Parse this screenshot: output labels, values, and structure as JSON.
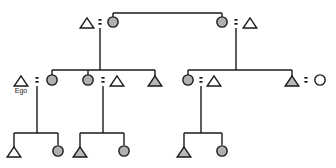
{
  "diagram": {
    "canvas": {
      "width": 336,
      "height": 168
    },
    "background_color": "#ffffff",
    "line_color": "#1a1a1a",
    "male_symbol": "triangle",
    "female_symbol": "circle",
    "shaded_fill": "#b4b4b4",
    "unshaded_fill": "#ffffff",
    "marriage_symbol": "equals-sign",
    "generations": 3,
    "nodes": [
      {
        "id": "g1-m1",
        "name": "generation1-male-left",
        "sex": "male",
        "shaded": false,
        "cx": 87,
        "cy": 23,
        "size": 11,
        "label": ""
      },
      {
        "id": "g1-f1",
        "name": "generation1-female-left",
        "sex": "female",
        "shaded": true,
        "cx": 113,
        "cy": 22,
        "size": 11,
        "label": ""
      },
      {
        "id": "g1-f2",
        "name": "generation1-female-right",
        "sex": "female",
        "shaded": true,
        "cx": 222,
        "cy": 22,
        "size": 11,
        "label": ""
      },
      {
        "id": "g1-m2",
        "name": "generation1-male-right",
        "sex": "male",
        "shaded": false,
        "cx": 250,
        "cy": 23,
        "size": 11,
        "label": ""
      },
      {
        "id": "g2-m1",
        "name": "generation2-ego-male",
        "sex": "male",
        "shaded": false,
        "cx": 21,
        "cy": 81,
        "size": 11,
        "label": "Ego"
      },
      {
        "id": "g2-f1",
        "name": "generation2-female-spouse-1",
        "sex": "female",
        "shaded": true,
        "cx": 52,
        "cy": 80,
        "size": 11,
        "label": ""
      },
      {
        "id": "g2-f2",
        "name": "generation2-female-sibling",
        "sex": "female",
        "shaded": true,
        "cx": 88,
        "cy": 80,
        "size": 11,
        "label": ""
      },
      {
        "id": "g2-m2",
        "name": "generation2-male-spouse-2",
        "sex": "male",
        "shaded": false,
        "cx": 117,
        "cy": 81,
        "size": 11,
        "label": ""
      },
      {
        "id": "g2-m3",
        "name": "generation2-male-sibling",
        "sex": "male",
        "shaded": true,
        "cx": 155,
        "cy": 81,
        "size": 11,
        "label": ""
      },
      {
        "id": "g2-f3",
        "name": "generation2-female-sibling-r",
        "sex": "female",
        "shaded": true,
        "cx": 188,
        "cy": 80,
        "size": 11,
        "label": ""
      },
      {
        "id": "g2-m4",
        "name": "generation2-male-spouse-3",
        "sex": "male",
        "shaded": false,
        "cx": 214,
        "cy": 81,
        "size": 11,
        "label": ""
      },
      {
        "id": "g2-m5",
        "name": "generation2-male-sibling-r",
        "sex": "male",
        "shaded": true,
        "cx": 292,
        "cy": 81,
        "size": 11,
        "label": ""
      },
      {
        "id": "g2-f4",
        "name": "generation2-female-spouse-4",
        "sex": "female",
        "shaded": false,
        "cx": 320,
        "cy": 80,
        "size": 11,
        "label": ""
      },
      {
        "id": "g3-m1",
        "name": "generation3-male-1",
        "sex": "male",
        "shaded": false,
        "cx": 14,
        "cy": 152,
        "size": 11,
        "label": ""
      },
      {
        "id": "g3-f1",
        "name": "generation3-female-1",
        "sex": "female",
        "shaded": true,
        "cx": 58,
        "cy": 151,
        "size": 11,
        "label": ""
      },
      {
        "id": "g3-m2",
        "name": "generation3-male-2",
        "sex": "male",
        "shaded": true,
        "cx": 80,
        "cy": 152,
        "size": 11,
        "label": ""
      },
      {
        "id": "g3-f2",
        "name": "generation3-female-2",
        "sex": "female",
        "shaded": true,
        "cx": 124,
        "cy": 151,
        "size": 11,
        "label": ""
      },
      {
        "id": "g3-m3",
        "name": "generation3-male-3",
        "sex": "male",
        "shaded": true,
        "cx": 184,
        "cy": 152,
        "size": 11,
        "label": ""
      },
      {
        "id": "g3-f3",
        "name": "generation3-female-3",
        "sex": "female",
        "shaded": true,
        "cx": 222,
        "cy": 151,
        "size": 11,
        "label": ""
      }
    ],
    "marriages": [
      {
        "id": "mar-1",
        "name": "marriage-generation1-left",
        "x": 100,
        "y": 22
      },
      {
        "id": "mar-2",
        "name": "marriage-generation1-right",
        "x": 236,
        "y": 22
      },
      {
        "id": "mar-3",
        "name": "marriage-ego-spouse",
        "x": 37,
        "y": 80
      },
      {
        "id": "mar-4",
        "name": "marriage-generation2-mid",
        "x": 103,
        "y": 80
      },
      {
        "id": "mar-5",
        "name": "marriage-generation2-right",
        "x": 201,
        "y": 80
      },
      {
        "id": "mar-6",
        "name": "marriage-generation2-far",
        "x": 306,
        "y": 80
      }
    ],
    "links": [
      {
        "id": "lnk-1",
        "name": "sibling-bar-generation1",
        "type": "horizontal",
        "x1": 113,
        "x2": 222,
        "y": 13
      },
      {
        "id": "lnk-2",
        "name": "riser-g1-female-left",
        "type": "vertical",
        "x": 113,
        "y1": 13,
        "y2": 22
      },
      {
        "id": "lnk-3",
        "name": "riser-g1-female-right",
        "type": "vertical",
        "x": 222,
        "y1": 13,
        "y2": 22
      },
      {
        "id": "lnk-4",
        "name": "descent-line-left-couple",
        "type": "vertical",
        "x": 100,
        "y1": 28,
        "y2": 70
      },
      {
        "id": "lnk-5",
        "name": "sibling-bar-generation2-left",
        "type": "horizontal",
        "x1": 52,
        "x2": 155,
        "y": 70
      },
      {
        "id": "lnk-6",
        "name": "drop-g2-female-spouse-1",
        "type": "vertical",
        "x": 52,
        "y1": 70,
        "y2": 76
      },
      {
        "id": "lnk-7",
        "name": "drop-g2-female-sibling",
        "type": "vertical",
        "x": 88,
        "y1": 70,
        "y2": 76
      },
      {
        "id": "lnk-8",
        "name": "drop-g2-male-sibling",
        "type": "vertical",
        "x": 155,
        "y1": 70,
        "y2": 76
      },
      {
        "id": "lnk-9",
        "name": "descent-line-right-couple",
        "type": "vertical",
        "x": 236,
        "y1": 28,
        "y2": 70
      },
      {
        "id": "lnk-10",
        "name": "sibling-bar-generation2-right",
        "type": "horizontal",
        "x1": 188,
        "x2": 292,
        "y": 70
      },
      {
        "id": "lnk-11",
        "name": "drop-g2-female-sibling-r",
        "type": "vertical",
        "x": 188,
        "y1": 70,
        "y2": 76
      },
      {
        "id": "lnk-12",
        "name": "drop-g2-male-sibling-r",
        "type": "vertical",
        "x": 292,
        "y1": 70,
        "y2": 76
      },
      {
        "id": "lnk-13",
        "name": "descent-line-ego-couple",
        "type": "vertical",
        "x": 37,
        "y1": 86,
        "y2": 133
      },
      {
        "id": "lnk-14",
        "name": "sibling-bar-generation3-left",
        "type": "horizontal",
        "x1": 14,
        "x2": 58,
        "y": 133
      },
      {
        "id": "lnk-15",
        "name": "drop-g3-male-1",
        "type": "vertical",
        "x": 14,
        "y1": 133,
        "y2": 147
      },
      {
        "id": "lnk-16",
        "name": "drop-g3-female-1",
        "type": "vertical",
        "x": 58,
        "y1": 133,
        "y2": 145
      },
      {
        "id": "lnk-17",
        "name": "descent-line-mid-couple",
        "type": "vertical",
        "x": 103,
        "y1": 86,
        "y2": 133
      },
      {
        "id": "lnk-18",
        "name": "sibling-bar-generation3-mid",
        "type": "horizontal",
        "x1": 80,
        "x2": 124,
        "y": 133
      },
      {
        "id": "lnk-19",
        "name": "drop-g3-male-2",
        "type": "vertical",
        "x": 80,
        "y1": 133,
        "y2": 147
      },
      {
        "id": "lnk-20",
        "name": "drop-g3-female-2",
        "type": "vertical",
        "x": 124,
        "y1": 133,
        "y2": 145
      },
      {
        "id": "lnk-21",
        "name": "descent-line-right2-couple",
        "type": "vertical",
        "x": 201,
        "y1": 86,
        "y2": 133
      },
      {
        "id": "lnk-22",
        "name": "sibling-bar-generation3-right",
        "type": "horizontal",
        "x1": 184,
        "x2": 222,
        "y": 133
      },
      {
        "id": "lnk-23",
        "name": "drop-g3-male-3",
        "type": "vertical",
        "x": 184,
        "y1": 133,
        "y2": 147
      },
      {
        "id": "lnk-24",
        "name": "drop-g3-female-3",
        "type": "vertical",
        "x": 222,
        "y1": 133,
        "y2": 145
      }
    ]
  }
}
